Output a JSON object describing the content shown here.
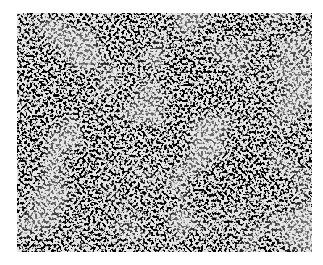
{
  "image": {
    "subject": "micrograph",
    "description": "Black-and-white optical micrograph showing a fine-grained granular microstructure",
    "colors": {
      "background": "#ffffff",
      "matrix": "#e6e6e6",
      "grain_boundary": "#111111"
    }
  }
}
